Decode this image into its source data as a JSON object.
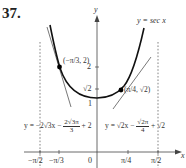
{
  "problem": {
    "number": "37."
  },
  "axes": {
    "x_label": "x",
    "y_label": "y",
    "x_ticks": [
      {
        "label": "−π/2",
        "value": "-pi/2"
      },
      {
        "label": "−π/3",
        "value": "-pi/3"
      },
      {
        "label": "0",
        "value": "0"
      },
      {
        "label": "π/4",
        "value": "pi/4"
      },
      {
        "label": "π/2",
        "value": "pi/2"
      }
    ],
    "y_ticks": [
      {
        "label": "2",
        "value": "2"
      },
      {
        "label": "√2",
        "value": "sqrt2"
      },
      {
        "label": "1",
        "value": "1"
      }
    ]
  },
  "curve": {
    "label": "y = sec x",
    "color": "#111111"
  },
  "asymptotes": [
    {
      "x": "-pi/2",
      "style": "dashed"
    },
    {
      "x": "pi/2",
      "style": "dashed"
    }
  ],
  "points": [
    {
      "label": "(−π/3, 2)",
      "x": "-pi/3",
      "y": "2"
    },
    {
      "label": "(π/4, √2)",
      "x": "pi/4",
      "y": "sqrt2"
    }
  ],
  "tangent_left": {
    "prefix": "y = −2√3x −",
    "frac_num": "2√3π",
    "frac_den": "3",
    "suffix": "+ 2"
  },
  "tangent_right": {
    "prefix": "y = √2x −",
    "frac_num": "√2π",
    "frac_den": "4",
    "suffix": "+ √2"
  },
  "colors": {
    "curve": "#111111",
    "tangent": "#555555",
    "axis": "#444444",
    "dashed": "#777777",
    "point": "#000000"
  }
}
